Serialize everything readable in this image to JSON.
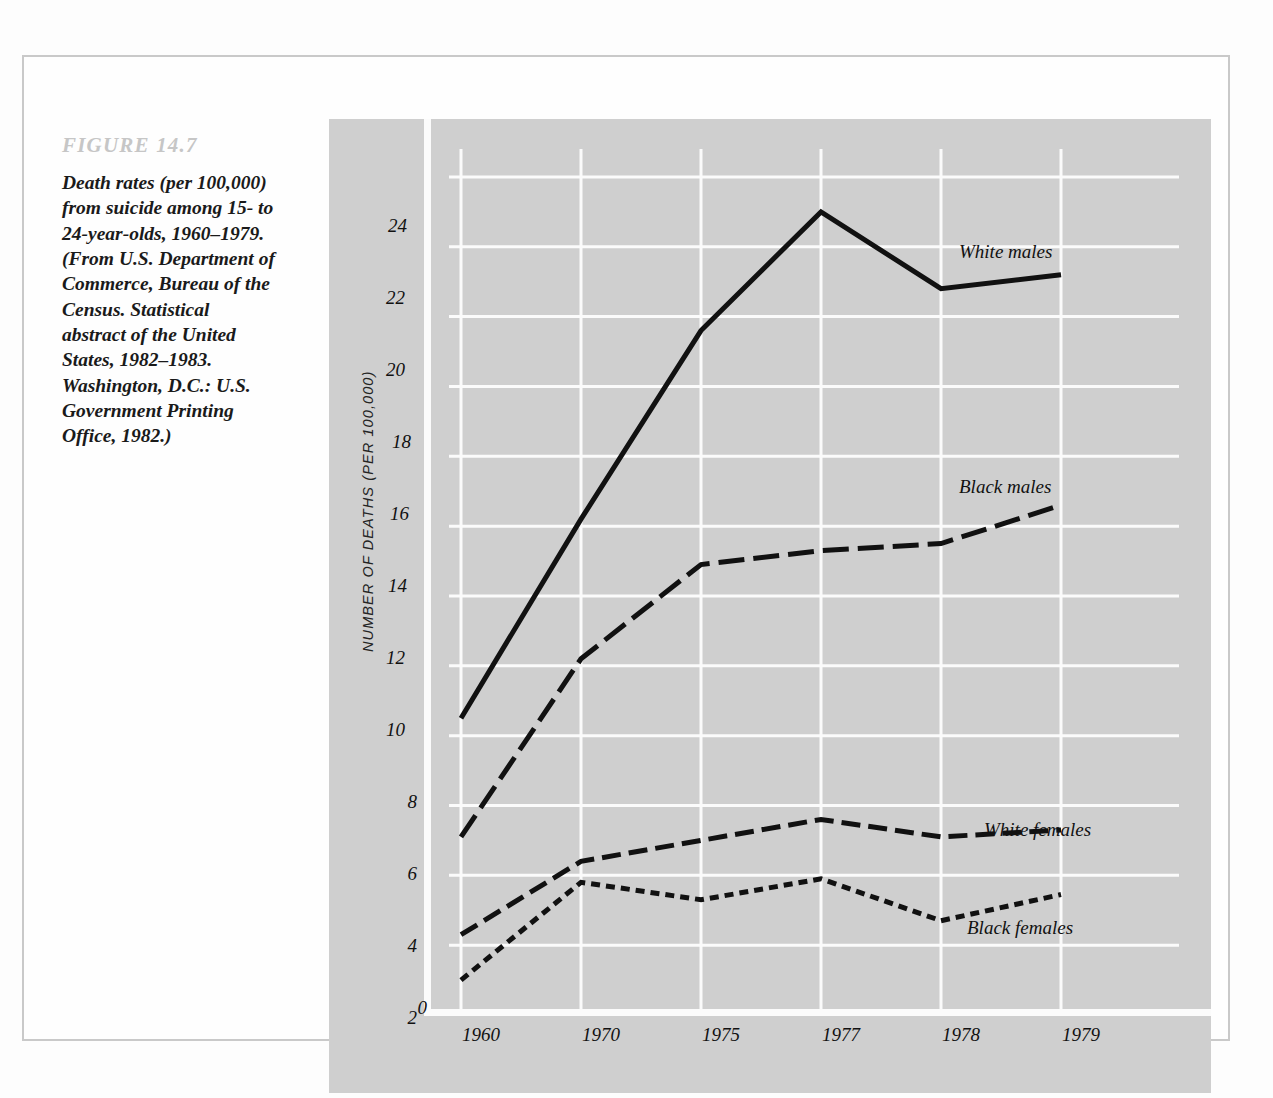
{
  "figure": {
    "number_label": "FIGURE 14.7",
    "caption": "Death rates (per 100,000) from suicide among 15- to 24-year-olds, 1960–1979. (From U.S. Department of Commerce, Bureau of the Census. Statistical abstract of the United States, 1982–1983. Washington, D.C.: U.S. Government Printing Office, 1982.)"
  },
  "colors": {
    "panel_background": "#cfcfcf",
    "gridline": "#fbfbfb",
    "line": "#111111",
    "frame_border": "#c9c9c9",
    "figure_number_text": "#c6c6c6"
  },
  "chart_data": {
    "type": "line",
    "title": "",
    "xlabel": "",
    "ylabel": "NUMBER OF DEATHS  (PER 100,000)",
    "categories": [
      "1960",
      "1970",
      "1975",
      "1977",
      "1978",
      "1979"
    ],
    "ylim": [
      0,
      24.8
    ],
    "yticks": [
      0,
      2,
      4,
      6,
      8,
      10,
      12,
      14,
      16,
      18,
      20,
      22,
      24
    ],
    "ytick_labels": [
      "0",
      "2",
      "4",
      "6",
      "8",
      "10",
      "12",
      "14",
      "16",
      "18",
      "20",
      "22",
      "24"
    ],
    "grid": "both",
    "legend": "inline-labels",
    "series": [
      {
        "name": "White males",
        "values": [
          8.5,
          14.2,
          19.6,
          23.0,
          20.8,
          21.2
        ],
        "dash": "solid"
      },
      {
        "name": "Black males",
        "values": [
          5.1,
          10.2,
          12.9,
          13.3,
          13.5,
          14.6
        ],
        "dash": "long-dash"
      },
      {
        "name": "White females",
        "values": [
          2.3,
          4.4,
          5.0,
          5.6,
          5.1,
          5.3
        ],
        "dash": "medium-dash"
      },
      {
        "name": "Black females",
        "values": [
          1.0,
          3.8,
          3.3,
          3.9,
          2.7,
          3.45
        ],
        "dash": "short-dash"
      }
    ]
  }
}
